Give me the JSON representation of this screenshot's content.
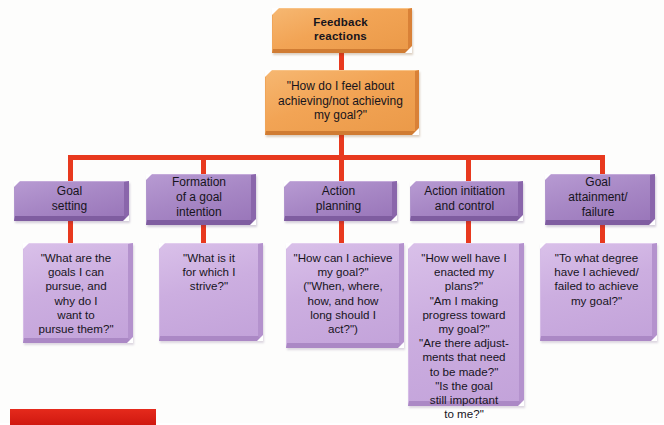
{
  "figure": {
    "title_box": {
      "label": "Feedback\nreactions",
      "color": "#f3a95c"
    },
    "question_box": {
      "label": "\"How do I feel about\nachieving/not achieving\nmy goal?\"",
      "color": "#f3a95c"
    },
    "connector_color": "#e8391e",
    "header_color": "#a585c4",
    "detail_color": "#ccaee0",
    "caption_bar": {
      "label": "",
      "color": "#dd2018"
    },
    "columns": [
      {
        "header": "Goal\nsetting",
        "detail": "\"What are the\ngoals I can\npursue, and\nwhy do I\nwant to\npursue them?\""
      },
      {
        "header": "Formation\nof a goal\nintention",
        "detail": "\"What is it\nfor which I\nstrive?\""
      },
      {
        "header": "Action\nplanning",
        "detail": "\"How can I achieve\nmy goal?\"\n(\"When, where,\nhow, and how\nlong should I\nact?\")"
      },
      {
        "header": "Action initiation\nand control",
        "detail": "\"How well have I\nenacted my plans?\"\n\"Am I making\nprogress toward\nmy goal?\"\n\"Are there adjust-\nments that need\nto be made?\"\n\"Is the goal\nstill important\nto me?\""
      },
      {
        "header": "Goal\nattainment/\nfailure",
        "detail": "\"To what degree\nhave I achieved/\nfailed to achieve\nmy goal?\""
      }
    ]
  }
}
